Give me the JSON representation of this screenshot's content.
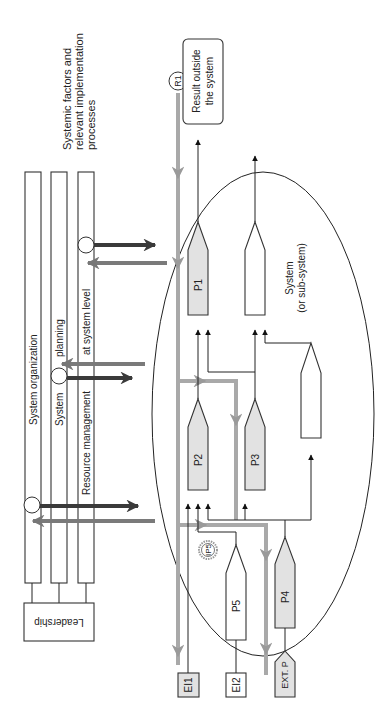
{
  "diagram": {
    "title_note": "Systemic factors and relevant implementation processes",
    "title_lines": [
      "Systemic factors and",
      "relevant implementation",
      "processes"
    ],
    "orientation": "rotated 90 degrees counter-clockwise (text reads bottom-to-top)",
    "bars": [
      {
        "id": "bar-1",
        "label": "System organization"
      },
      {
        "id": "bar-2",
        "label_parts": [
          "System",
          "planning"
        ]
      },
      {
        "id": "bar-3",
        "label_parts": [
          "Resource management",
          "at system level"
        ]
      }
    ],
    "leadership": {
      "label": "Leadership"
    },
    "result": {
      "marker": "R1",
      "box_lines": [
        "Result outside",
        "the system"
      ]
    },
    "system": {
      "label_lines": [
        "System",
        "(or sub-system)"
      ]
    },
    "processes": [
      {
        "id": "P1",
        "label": "P1",
        "shaded": true
      },
      {
        "id": "P1b",
        "label": "",
        "shaded": false
      },
      {
        "id": "P2",
        "label": "P2",
        "shaded": true
      },
      {
        "id": "P3",
        "label": "P3",
        "shaded": true
      },
      {
        "id": "Pblank",
        "label": "",
        "shaded": false
      },
      {
        "id": "P5",
        "label": "P5",
        "shaded": false
      },
      {
        "id": "P4",
        "label": "P4",
        "shaded": true
      }
    ],
    "external_process": {
      "label": "EXT. P"
    },
    "external_inputs": [
      {
        "id": "EI1",
        "label": "EI1",
        "shaded": true
      },
      {
        "id": "EI2",
        "label": "EI2",
        "shaded": false
      }
    ],
    "intermediate_marker": {
      "label": "IP5"
    },
    "colors": {
      "line": "#222222",
      "shaded_fill": "#e2e2e2",
      "gray_flow": "#a9a9a9",
      "dark_flow": "#3a3a3a"
    }
  }
}
